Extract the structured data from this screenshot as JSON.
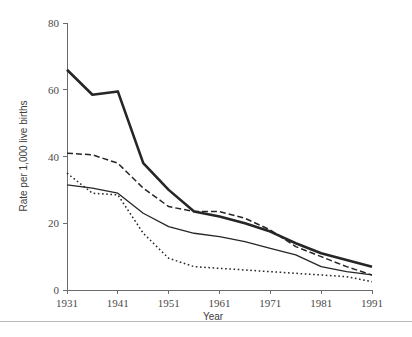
{
  "chart_data": {
    "type": "line",
    "title": "",
    "xlabel": "Year",
    "ylabel": "Rate per 1,000 live births",
    "xlim": [
      1931,
      1991
    ],
    "ylim": [
      0,
      80
    ],
    "xticks": [
      1931,
      1941,
      1951,
      1961,
      1971,
      1981,
      1991
    ],
    "yticks": [
      0,
      20,
      40,
      60,
      80
    ],
    "grid": false,
    "legend": "none",
    "x": [
      1931,
      1936,
      1941,
      1946,
      1951,
      1956,
      1961,
      1966,
      1971,
      1976,
      1981,
      1986,
      1991
    ],
    "series": [
      {
        "name": "series-thick-solid",
        "style": "solid-thick",
        "color": "#262626",
        "width": 2.6,
        "values": [
          66.0,
          58.5,
          59.5,
          38.0,
          30.0,
          23.5,
          22.0,
          20.0,
          17.5,
          14.0,
          11.0,
          9.0,
          7.0
        ]
      },
      {
        "name": "series-dashed",
        "style": "dashed",
        "color": "#262626",
        "width": 1.5,
        "values": [
          41.0,
          40.5,
          38.0,
          30.5,
          25.0,
          23.5,
          23.5,
          21.5,
          18.0,
          13.0,
          10.0,
          7.0,
          4.5
        ]
      },
      {
        "name": "series-thin-solid",
        "style": "solid-thin",
        "color": "#262626",
        "width": 1.3,
        "values": [
          31.5,
          30.5,
          29.0,
          23.0,
          19.0,
          17.0,
          16.0,
          14.5,
          12.5,
          10.5,
          7.0,
          5.5,
          4.5
        ]
      },
      {
        "name": "series-dotted",
        "style": "dotted",
        "color": "#262626",
        "width": 1.5,
        "values": [
          35.0,
          29.0,
          28.5,
          17.0,
          9.5,
          7.0,
          6.5,
          6.0,
          5.5,
          5.0,
          4.5,
          4.0,
          2.5
        ]
      }
    ]
  },
  "axes": {
    "y_tick_labels": [
      "0",
      "20",
      "40",
      "60",
      "80"
    ],
    "x_tick_labels": [
      "1931",
      "1941",
      "1951",
      "1961",
      "1971",
      "1981",
      "1991"
    ],
    "x_axis_title": "Year",
    "y_axis_title": "Rate per 1,000 live births"
  },
  "colors": {
    "axis": "#6b6b6b",
    "ink": "#262626",
    "text": "#4a4a4a",
    "rule": "#b9b9b9",
    "background": "#ffffff"
  }
}
